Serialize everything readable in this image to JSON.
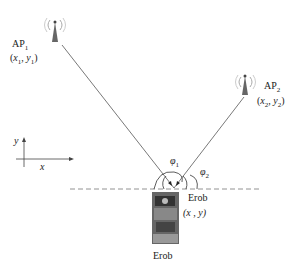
{
  "diagram": {
    "ap1": {
      "name": "AP",
      "sub": "1",
      "coord_open": "(",
      "x": "x",
      "xsub": "1",
      "sep": ", ",
      "y": "y",
      "ysub": "1",
      "coord_close": ")"
    },
    "ap2": {
      "name": "AP",
      "sub": "2",
      "coord_open": "(",
      "x": "x",
      "xsub": "2",
      "sep": ", ",
      "y": "y",
      "ysub": "2",
      "coord_close": ")"
    },
    "axes": {
      "x_label": "x",
      "y_label": "y"
    },
    "angles": {
      "phi1": "φ",
      "phi1_sub": "1",
      "phi2": "φ",
      "phi2_sub": "2"
    },
    "robot": {
      "label_right": "Erob",
      "coord": "(x , y)",
      "label_below": "Erob"
    },
    "colors": {
      "line": "#555555",
      "antenna": "#666666",
      "text": "#222222"
    }
  }
}
